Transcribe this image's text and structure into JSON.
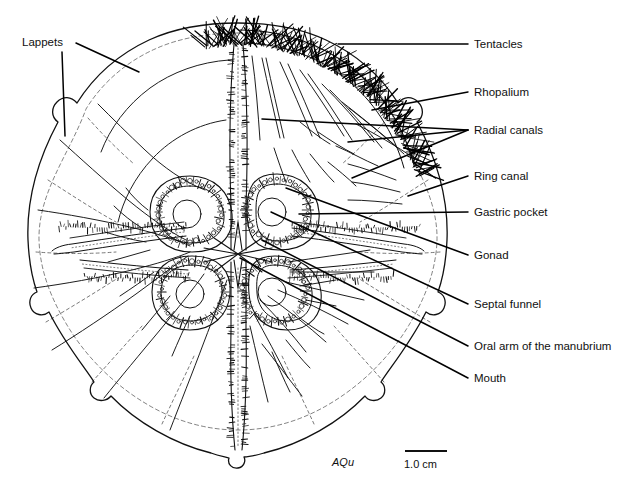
{
  "figure": {
    "type": "scientific-line-drawing",
    "background_color": "#ffffff",
    "ink_color": "#111111",
    "signature": "AQu"
  },
  "scale_bar": {
    "label": "1.0 cm",
    "bar_x1": 405,
    "bar_x2": 447,
    "bar_y": 451,
    "label_x": 404,
    "label_y": 468
  },
  "labels": [
    {
      "id": "lappets",
      "text": "Lappets",
      "x": 22,
      "y": 46,
      "anchor": "start",
      "leaders": [
        {
          "x1": 76,
          "y1": 43,
          "x2": 139,
          "y2": 72
        },
        {
          "x1": 62,
          "y1": 52,
          "x2": 65,
          "y2": 136
        }
      ]
    },
    {
      "id": "tentacles",
      "text": "Tentacles",
      "x": 474,
      "y": 48,
      "anchor": "start",
      "leaders": [
        {
          "x1": 468,
          "y1": 44,
          "x2": 338,
          "y2": 44
        }
      ]
    },
    {
      "id": "rhopalium",
      "text": "Rhopalium",
      "x": 474,
      "y": 96,
      "anchor": "start",
      "leaders": [
        {
          "x1": 468,
          "y1": 92,
          "x2": 372,
          "y2": 110
        }
      ]
    },
    {
      "id": "radial-canals",
      "text": "Radial canals",
      "x": 474,
      "y": 134,
      "anchor": "start",
      "leaders": [
        {
          "x1": 468,
          "y1": 130,
          "x2": 262,
          "y2": 119
        },
        {
          "x1": 468,
          "y1": 130,
          "x2": 348,
          "y2": 142
        },
        {
          "x1": 468,
          "y1": 130,
          "x2": 352,
          "y2": 178
        }
      ]
    },
    {
      "id": "ring-canal",
      "text": "Ring canal",
      "x": 474,
      "y": 180,
      "anchor": "start",
      "leaders": [
        {
          "x1": 468,
          "y1": 176,
          "x2": 408,
          "y2": 196
        }
      ]
    },
    {
      "id": "gastric-pocket",
      "text": "Gastric pocket",
      "x": 474,
      "y": 216,
      "anchor": "start",
      "leaders": [
        {
          "x1": 468,
          "y1": 212,
          "x2": 299,
          "y2": 214
        }
      ]
    },
    {
      "id": "gonad",
      "text": "Gonad",
      "x": 474,
      "y": 259,
      "anchor": "start",
      "leaders": [
        {
          "x1": 468,
          "y1": 255,
          "x2": 286,
          "y2": 188
        }
      ]
    },
    {
      "id": "septal-funnel",
      "text": "Septal funnel",
      "x": 474,
      "y": 308,
      "anchor": "start",
      "leaders": [
        {
          "x1": 468,
          "y1": 304,
          "x2": 271,
          "y2": 212
        }
      ]
    },
    {
      "id": "oral-arm-of-the-manubrium",
      "text": "Oral arm of the manubrium",
      "x": 474,
      "y": 350,
      "anchor": "start",
      "leaders": [
        {
          "x1": 468,
          "y1": 346,
          "x2": 262,
          "y2": 240
        }
      ]
    },
    {
      "id": "mouth",
      "text": "Mouth",
      "x": 474,
      "y": 382,
      "anchor": "start",
      "leaders": [
        {
          "x1": 468,
          "y1": 378,
          "x2": 240,
          "y2": 258
        }
      ]
    }
  ],
  "anatomy": {
    "bell": {
      "center_x": 238,
      "center_y": 245,
      "radius_x": 212,
      "radius_y": 222,
      "lobe_count": 8
    },
    "gastric_pockets": [
      {
        "cx": 190,
        "cy": 212,
        "quadrant": "upper-left"
      },
      {
        "cx": 277,
        "cy": 210,
        "quadrant": "upper-right"
      },
      {
        "cx": 192,
        "cy": 292,
        "quadrant": "lower-left"
      },
      {
        "cx": 275,
        "cy": 291,
        "quadrant": "lower-right"
      }
    ],
    "septal_funnels": [
      {
        "cx": 187,
        "cy": 214,
        "r": 14
      },
      {
        "cx": 272,
        "cy": 212,
        "r": 14
      },
      {
        "cx": 190,
        "cy": 294,
        "r": 14
      },
      {
        "cx": 272,
        "cy": 292,
        "r": 14
      }
    ],
    "mouth": {
      "cx": 238,
      "cy": 254,
      "arm_length": 34
    },
    "tentacle_band": {
      "start_angle": -100,
      "end_angle": -20,
      "description": "dense marginal tentacle fringe along upper-right bell margin"
    },
    "oral_arms": 4,
    "rhopalia": [
      {
        "cx": 95,
        "cy": 100
      },
      {
        "cx": 30,
        "cy": 254
      },
      {
        "cx": 98,
        "cy": 390
      },
      {
        "cx": 238,
        "cy": 457
      },
      {
        "cx": 380,
        "cy": 390
      },
      {
        "cx": 447,
        "cy": 254
      },
      {
        "cx": 380,
        "cy": 103
      },
      {
        "cx": 240,
        "cy": 42
      }
    ]
  }
}
